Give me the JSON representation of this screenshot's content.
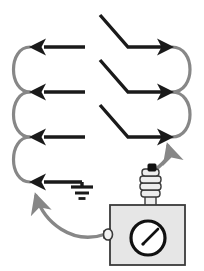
{
  "figure": {
    "title": "Serpentine scan path with grounded surface and measuring instrument",
    "width": 204,
    "height": 271,
    "background": "#ffffff"
  },
  "colors": {
    "stroke_black": "#1a1a1a",
    "stroke_gray": "#878787",
    "instrument_fill": "#e6e6e6",
    "instrument_stroke": "#3a3a3a",
    "insulator_fill": "#ededed",
    "gauge_face": "#ffffff",
    "gauge_ring": "#111111",
    "terminal_black": "#111111"
  },
  "path": {
    "type": "serpentine-scan",
    "direction": "right-to-left on straight passes, left-to-right on zigzag passes",
    "row_count": 4,
    "rows": [
      {
        "index": 0,
        "y": 47,
        "kind": "straight-arrow-left",
        "label": "pass-1"
      },
      {
        "index": 1,
        "y": 92,
        "kind": "straight-arrow-left",
        "label": "pass-2"
      },
      {
        "index": 2,
        "y": 137,
        "kind": "straight-arrow-left",
        "label": "pass-3"
      },
      {
        "index": 3,
        "y": 182,
        "kind": "straight-arrow-left-grounded",
        "label": "pass-4"
      }
    ],
    "zigzag_rows": [
      {
        "index": 0,
        "y": 47,
        "kind": "bent-arrow-right",
        "label": "return-1"
      },
      {
        "index": 1,
        "y": 92,
        "kind": "bent-arrow-right",
        "label": "return-2"
      },
      {
        "index": 2,
        "y": 137,
        "kind": "bent-arrow-right",
        "label": "return-3"
      }
    ],
    "left_arcs": 3,
    "right_arcs": 2
  },
  "ground": {
    "name": "earth-ground-symbol",
    "bar_widths": [
      22,
      14,
      7
    ],
    "position": {
      "x": 82,
      "y": 186
    }
  },
  "instrument": {
    "name": "measuring-instrument",
    "box": {
      "x": 110,
      "y": 205,
      "w": 75,
      "h": 60
    },
    "gauge": {
      "name": "analog-gauge",
      "cx": 148,
      "cy": 238,
      "r": 17,
      "needle_angle_deg": -55,
      "reading": ""
    },
    "insulator": {
      "name": "ribbed-insulator",
      "rings": 4,
      "x": 139,
      "y": 168,
      "w": 22,
      "h": 37
    },
    "top_terminal": {
      "name": "hv-terminal",
      "x": 152,
      "y": 169
    },
    "side_terminal": {
      "name": "ground-terminal",
      "cx": 108,
      "cy": 234
    }
  },
  "lead_wires": [
    {
      "name": "upper-lead-wire",
      "from": "hv-terminal",
      "to": "pass-3 right end",
      "color": "#878787",
      "arrowhead": "up-left"
    },
    {
      "name": "lower-lead-wire",
      "from": "ground-terminal",
      "to": "pass-4 left end",
      "color": "#878787",
      "arrowhead": "up"
    }
  ]
}
